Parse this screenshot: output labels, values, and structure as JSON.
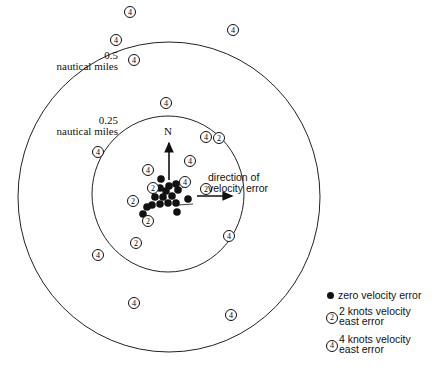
{
  "labels": {
    "outer_radius": "0.5",
    "outer_unit": "nautical miles",
    "inner_radius": "0.25",
    "inner_unit": "nautical miles",
    "north": "N",
    "direction_line1": "direction of",
    "direction_line2": "velocity error"
  },
  "legend": {
    "zero": "zero velocity error",
    "two_line1": "2 knots velocity",
    "two_line2": "east error",
    "two_symbol": "2",
    "four_line1": "4 knots velocity",
    "four_line2": "east error",
    "four_symbol": "4"
  },
  "circles": {
    "outer": {
      "cx": 169,
      "cy": 197,
      "r": 153,
      "label": "0.5 nautical miles"
    },
    "inner": {
      "cx": 168,
      "cy": 194,
      "r": 77,
      "label": "0.25 nautical miles"
    }
  },
  "points": {
    "zero_velocity": [
      [
        161,
        179
      ],
      [
        160,
        188
      ],
      [
        169,
        186
      ],
      [
        176,
        184
      ],
      [
        166,
        191
      ],
      [
        178,
        190
      ],
      [
        172,
        196
      ],
      [
        155,
        197
      ],
      [
        163,
        197
      ],
      [
        160,
        204
      ],
      [
        168,
        203
      ],
      [
        176,
        203
      ],
      [
        147,
        207
      ],
      [
        188,
        199
      ],
      [
        177,
        212
      ],
      [
        143,
        214
      ],
      [
        152,
        205
      ]
    ],
    "two_knots": [
      [
        153,
        188
      ],
      [
        206,
        189
      ],
      [
        133,
        201
      ],
      [
        148,
        221
      ],
      [
        136,
        243
      ],
      [
        219,
        138
      ]
    ],
    "four_knots": [
      [
        130,
        12
      ],
      [
        116,
        40
      ],
      [
        134,
        60
      ],
      [
        166,
        103
      ],
      [
        206,
        137
      ],
      [
        148,
        170
      ],
      [
        190,
        161
      ],
      [
        185,
        182
      ],
      [
        98,
        152
      ],
      [
        98,
        255
      ],
      [
        229,
        236
      ],
      [
        233,
        30
      ],
      [
        134,
        303
      ],
      [
        231,
        315
      ]
    ]
  },
  "colors": {
    "ink": "#111111",
    "background": "#ffffff"
  }
}
